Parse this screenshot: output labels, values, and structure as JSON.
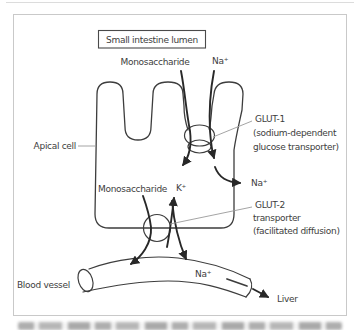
{
  "diagram": {
    "title_box": "Small intestine lumen",
    "labels": {
      "monosaccharide_top": "Monosaccharide",
      "na_top": "Na⁺",
      "apical_cell": "Apical cell",
      "glut1_line1": "GLUT-1",
      "glut1_line2": "(sodium-dependent",
      "glut1_line3": "glucose transporter)",
      "na_exit": "Na⁺",
      "glut2_line1": "GLUT-2",
      "glut2_line2": "transporter",
      "glut2_line3": "(facilitated diffusion)",
      "monosaccharide_inner": "Monosaccharide",
      "k_ion": "K⁺",
      "blood_vessel": "Blood vessel",
      "na_vessel": "Na⁺",
      "liver": "Liver"
    },
    "colors": {
      "outline_stroke": "#3d3d3d",
      "arrow_stroke": "#282828",
      "label_line": "#9a9a9a",
      "frame_border": "#c9c9c9",
      "text": "#3d3d3d"
    }
  }
}
